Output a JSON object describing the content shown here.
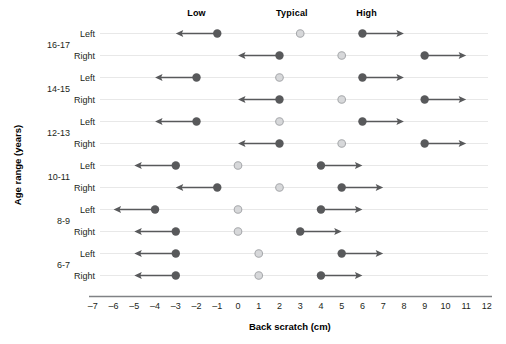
{
  "figure": {
    "x_axis_title": "Back scratch (cm)",
    "y_axis_title": "Age range (years)",
    "column_headers": [
      {
        "label": "Low",
        "x": -2.0
      },
      {
        "label": "Typical",
        "x": 2.6
      },
      {
        "label": "High",
        "x": 6.2
      }
    ],
    "side_labels": [
      "Left",
      "Right"
    ],
    "age_groups": [
      "16-17",
      "14-15",
      "12-13",
      "10-11",
      "8-9",
      "6-7"
    ],
    "tick_labels": [
      "–7",
      "–6",
      "–5",
      "–4",
      "–3",
      "–2",
      "–1",
      "0",
      "1",
      "2",
      "3",
      "4",
      "5",
      "6",
      "7",
      "8",
      "9",
      "10",
      "11",
      "12"
    ],
    "colors": {
      "dark_marker": "#58595b",
      "light_marker": "#d7d8da",
      "light_marker_edge": "#a7a9ac",
      "arrow": "#58595b",
      "row_line": "#e8e8e8",
      "axis": "#808285",
      "text": "#231f20"
    }
  },
  "chart_data": {
    "type": "scatter",
    "title": "",
    "xlabel": "Back scratch (cm)",
    "ylabel": "Age range (years)",
    "xlim": [
      -7,
      12
    ],
    "xticks": [
      -7,
      -6,
      -5,
      -4,
      -3,
      -2,
      -1,
      0,
      1,
      2,
      3,
      4,
      5,
      6,
      7,
      8,
      9,
      10,
      11,
      12
    ],
    "grid": false,
    "legend": [
      "Low",
      "Typical",
      "High"
    ],
    "legend_position": "top",
    "marker_notes": "Dark filled circles = Low and High cut-points with open-ended arrows; light open circle = Typical value.",
    "rows": [
      {
        "age_range": "16-17",
        "side": "Left",
        "low": {
          "value": -1,
          "arrow": "left",
          "arrow_to": -3
        },
        "typical": {
          "value": 3
        },
        "high": {
          "value": 6,
          "arrow": "right",
          "arrow_to": 8
        }
      },
      {
        "age_range": "16-17",
        "side": "Right",
        "low": {
          "value": 2,
          "arrow": "left",
          "arrow_to": 0
        },
        "typical": {
          "value": 5
        },
        "high": {
          "value": 9,
          "arrow": "right",
          "arrow_to": 11
        }
      },
      {
        "age_range": "14-15",
        "side": "Left",
        "low": {
          "value": -2,
          "arrow": "left",
          "arrow_to": -4
        },
        "typical": {
          "value": 2
        },
        "high": {
          "value": 6,
          "arrow": "right",
          "arrow_to": 8
        }
      },
      {
        "age_range": "14-15",
        "side": "Right",
        "low": {
          "value": 2,
          "arrow": "left",
          "arrow_to": 0
        },
        "typical": {
          "value": 5
        },
        "high": {
          "value": 9,
          "arrow": "right",
          "arrow_to": 11
        }
      },
      {
        "age_range": "12-13",
        "side": "Left",
        "low": {
          "value": -2,
          "arrow": "left",
          "arrow_to": -4
        },
        "typical": {
          "value": 2
        },
        "high": {
          "value": 6,
          "arrow": "right",
          "arrow_to": 8
        }
      },
      {
        "age_range": "12-13",
        "side": "Right",
        "low": {
          "value": 2,
          "arrow": "left",
          "arrow_to": 0
        },
        "typical": {
          "value": 5
        },
        "high": {
          "value": 9,
          "arrow": "right",
          "arrow_to": 11
        }
      },
      {
        "age_range": "10-11",
        "side": "Left",
        "low": {
          "value": -3,
          "arrow": "left",
          "arrow_to": -5
        },
        "typical": {
          "value": 0
        },
        "high": {
          "value": 4,
          "arrow": "right",
          "arrow_to": 6
        }
      },
      {
        "age_range": "10-11",
        "side": "Right",
        "low": {
          "value": -1,
          "arrow": "left",
          "arrow_to": -3
        },
        "typical": {
          "value": 2
        },
        "high": {
          "value": 5,
          "arrow": "right",
          "arrow_to": 7
        }
      },
      {
        "age_range": "8-9",
        "side": "Left",
        "low": {
          "value": -4,
          "arrow": "left",
          "arrow_to": -6
        },
        "typical": {
          "value": 0
        },
        "high": {
          "value": 4,
          "arrow": "right",
          "arrow_to": 6
        }
      },
      {
        "age_range": "8-9",
        "side": "Right",
        "low": {
          "value": -3,
          "arrow": "left",
          "arrow_to": -5
        },
        "typical": {
          "value": 0
        },
        "high": {
          "value": 3,
          "arrow": "right",
          "arrow_to": 5
        }
      },
      {
        "age_range": "6-7",
        "side": "Left",
        "low": {
          "value": -3,
          "arrow": "left",
          "arrow_to": -5
        },
        "typical": {
          "value": 1
        },
        "high": {
          "value": 5,
          "arrow": "right",
          "arrow_to": 7
        }
      },
      {
        "age_range": "6-7",
        "side": "Right",
        "low": {
          "value": -3,
          "arrow": "left",
          "arrow_to": -5
        },
        "typical": {
          "value": 1
        },
        "high": {
          "value": 4,
          "arrow": "right",
          "arrow_to": 6
        }
      }
    ]
  }
}
